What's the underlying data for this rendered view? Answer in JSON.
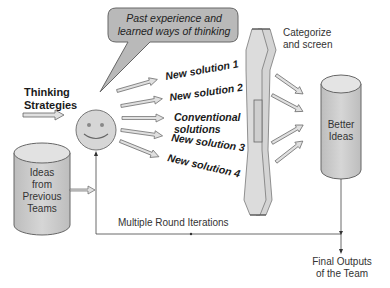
{
  "diagram": {
    "bubble_text": [
      "Past experience and",
      "learned ways of thinking"
    ],
    "thinking_strategies": [
      "Thinking",
      "Strategies"
    ],
    "previous_ideas": [
      "Ideas",
      "from",
      "Previous",
      "Teams"
    ],
    "solutions": [
      {
        "lines": [
          "New solution 1"
        ],
        "angle": -10
      },
      {
        "lines": [
          "New solution 2"
        ],
        "angle": -8
      },
      {
        "lines": [
          "Conventional",
          "solutions"
        ],
        "angle": 0
      },
      {
        "lines": [
          "New solution 3"
        ],
        "angle": 8
      },
      {
        "lines": [
          "New solution 4"
        ],
        "angle": 13
      }
    ],
    "categorize": [
      "Categorize",
      "and screen"
    ],
    "better_ideas": [
      "Better",
      "Ideas"
    ],
    "iterations_label": "Multiple Round Iterations",
    "final_outputs": [
      "Final Outputs",
      "of the Team"
    ]
  },
  "colors": {
    "shape_fill": "#cfcfcf",
    "light_fill": "#e2e2e2",
    "bubble_fill": "#b8b8b8",
    "stroke": "#555555"
  }
}
